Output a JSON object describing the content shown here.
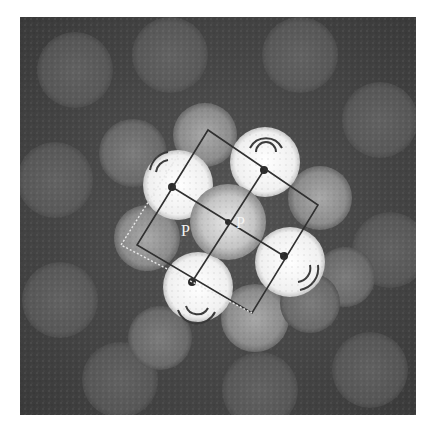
{
  "figure": {
    "labels": [
      {
        "id": "p1",
        "text": "P"
      },
      {
        "id": "p2",
        "text": "P"
      }
    ],
    "colors": {
      "background": "#4a4a4a",
      "disk_bright": "#f4f4f4",
      "disk_dim": "#7a7a7a",
      "overlay_line": "#333333",
      "dashed_line": "#e8e8e8"
    }
  }
}
